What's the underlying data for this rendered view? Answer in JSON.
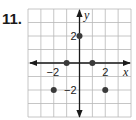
{
  "problem": {
    "number": "11."
  },
  "chart_data": {
    "type": "scatter",
    "title": "",
    "xlabel": "x",
    "ylabel": "y",
    "xlim": [
      -4,
      4
    ],
    "ylim": [
      -4,
      4
    ],
    "grid": true,
    "x_tick_labels": [
      {
        "value": -2,
        "label": "−2"
      },
      {
        "value": 2,
        "label": "2"
      }
    ],
    "y_tick_labels": [
      {
        "value": 2,
        "label": "2"
      },
      {
        "value": -2,
        "label": "−2"
      }
    ],
    "points": [
      {
        "x": 0,
        "y": 2
      },
      {
        "x": -1,
        "y": 0
      },
      {
        "x": 1,
        "y": 0
      },
      {
        "x": -2,
        "y": -2
      },
      {
        "x": 2,
        "y": -2
      }
    ],
    "colors": {
      "grid": "#b8b8b8",
      "axis": "#1a1a1a",
      "point": "#3a3a3a"
    }
  }
}
